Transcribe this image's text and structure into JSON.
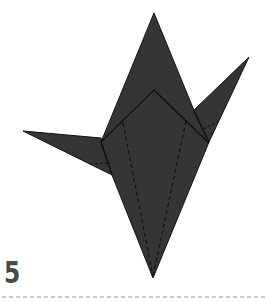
{
  "diagram": {
    "type": "origami-instruction",
    "step_number": "5",
    "colors": {
      "paper_fill": "#353535",
      "outline": "#111111",
      "dashed_fold": "#111111",
      "step_number": "#4a4a4a",
      "baseline": "#9a9a9a"
    },
    "shapes": {
      "main_body": "154,13 209,120 206,140 153,278 112,175 101,142",
      "right_wing": "193,111 249,57 209,142",
      "left_wing": "23,131 101,138 112,175",
      "inner_pentagon": "101,142 154,90 209,143",
      "fold_lines": [
        "123,123 153,276",
        "186,121 153,276",
        "90,165 108,165",
        "200,130 217,122"
      ]
    }
  }
}
